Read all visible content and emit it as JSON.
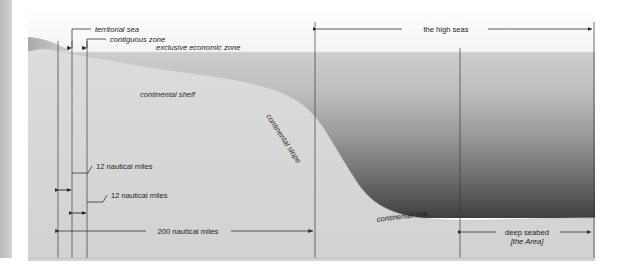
{
  "diagram": {
    "zone_labels": {
      "territorial_sea": "territorial sea",
      "contiguous_zone": "contiguous zone",
      "exclusive_economic_zone": "exclusive economic zone",
      "high_seas": "the high seas"
    },
    "seafloor_labels": {
      "continental_shelf": "continental shelf",
      "continental_slope": "continental slope",
      "continental_rise": "continental rise"
    },
    "measure_labels": {
      "twelve_nm_territorial": "12 nautical miles",
      "twelve_nm_contiguous": "12 nautical miles",
      "two_hundred_nm": "200 nautical miles"
    },
    "seabed_label": {
      "line1": "deep seabed",
      "line2": "[the Area]"
    },
    "colors": {
      "water_shallow": "#c9c9c9",
      "water_deep": "#4a4a4a",
      "land": "#b5b5b5",
      "seabed": "#d8d8d8",
      "sky": "#f7f7f7",
      "rule": "#3a3a3a",
      "left_bar": "#c2c2c2"
    }
  }
}
